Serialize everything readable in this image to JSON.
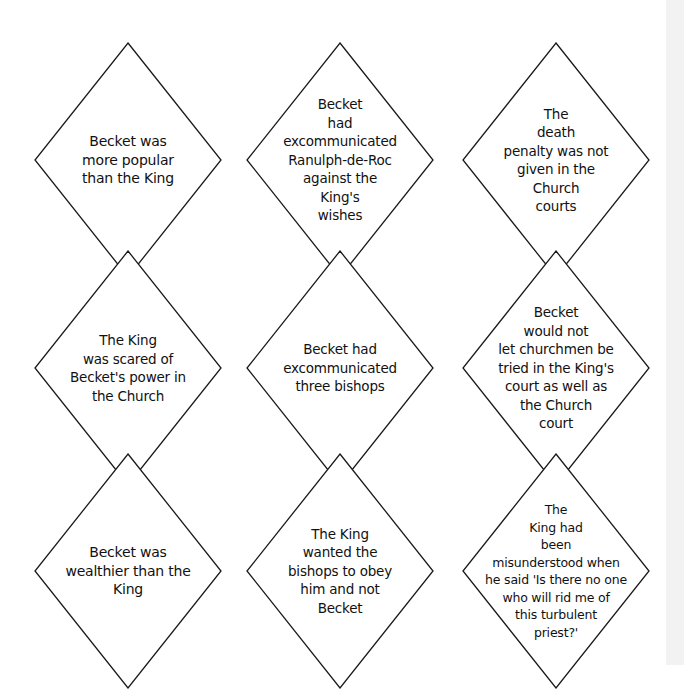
{
  "cards": [
    {
      "id": "card-1",
      "lines": [
        "Becket was",
        "more popular",
        "than the King"
      ]
    },
    {
      "id": "card-2",
      "lines": [
        "Becket",
        "had",
        "excommunicated",
        "Ranulph-de-Roc",
        "against the",
        "King's",
        "wishes"
      ]
    },
    {
      "id": "card-3",
      "lines": [
        "The",
        "death",
        "penalty was not",
        "given in the",
        "Church",
        "courts"
      ]
    },
    {
      "id": "card-4",
      "lines": [
        "The King",
        "was scared of",
        "Becket's power in",
        "the Church"
      ]
    },
    {
      "id": "card-5",
      "lines": [
        "Becket had",
        "excommunicated",
        "three bishops"
      ]
    },
    {
      "id": "card-6",
      "lines": [
        "Becket",
        "would not",
        "let churchmen be",
        "tried in the King's",
        "court as well as",
        "the Church",
        "court"
      ]
    },
    {
      "id": "card-7",
      "lines": [
        "Becket was",
        "wealthier than the",
        "King"
      ]
    },
    {
      "id": "card-8",
      "lines": [
        "The King",
        "wanted the",
        "bishops to obey",
        "him and not",
        "Becket"
      ]
    },
    {
      "id": "card-9",
      "lines": [
        "The",
        "King had",
        "been",
        "misunderstood when",
        "he said 'Is there no one",
        "who will rid me of",
        "this turbulent",
        "priest?'"
      ]
    }
  ],
  "style": {
    "stroke_color": "#1a1a1a",
    "fill_color": "#ffffff",
    "text_color": "#111111"
  }
}
